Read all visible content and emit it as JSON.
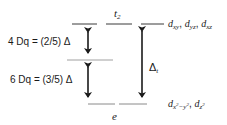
{
  "diagram": {
    "upper_level": {
      "label": "t",
      "label_sub": "2",
      "orbitals": [
        {
          "d": "d",
          "sub": "xy"
        },
        {
          "d": "d",
          "sub": "yz"
        },
        {
          "d": "d",
          "sub": "xz"
        }
      ]
    },
    "lower_level": {
      "label": "e",
      "orbitals": [
        {
          "d": "d",
          "sub": "x",
          "sup1": "2",
          "mid": "−y",
          "sup2": "2"
        },
        {
          "d": "d",
          "sub": "z",
          "sup1": "2"
        }
      ]
    },
    "upper_gap_label": "4 Dq = (2/5) Δ",
    "lower_gap_label": "6 Dq = (3/5) Δ",
    "total_gap_label": "Δ",
    "total_gap_sub": "t",
    "colors": {
      "line": "#3a3a3a",
      "barycenter": "#a0a0a0",
      "text": "#1a1a1a"
    }
  }
}
